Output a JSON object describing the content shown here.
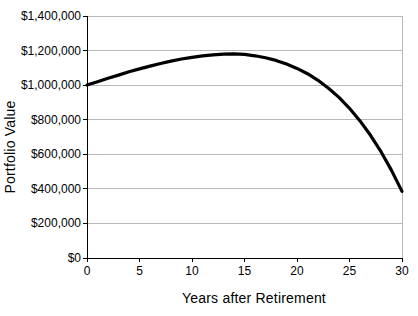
{
  "chart_data": {
    "type": "line",
    "title": "",
    "xlabel": "Years after Retirement",
    "ylabel": "Portfolio Value",
    "x": [
      0,
      1,
      2,
      3,
      4,
      5,
      6,
      7,
      8,
      9,
      10,
      11,
      12,
      13,
      14,
      15,
      16,
      17,
      18,
      19,
      20,
      21,
      22,
      23,
      24,
      25,
      26,
      27,
      28,
      29,
      30
    ],
    "values": [
      1000000,
      1020000,
      1040000,
      1058000,
      1077000,
      1094000,
      1110000,
      1125000,
      1139000,
      1151000,
      1161000,
      1169000,
      1175000,
      1179000,
      1181000,
      1178000,
      1170000,
      1158000,
      1143000,
      1122000,
      1097000,
      1066000,
      1028000,
      982000,
      929000,
      866000,
      793000,
      710000,
      615000,
      507000,
      385000
    ],
    "xlim": [
      0,
      30
    ],
    "ylim": [
      0,
      1400000
    ],
    "x_ticks": [
      0,
      5,
      10,
      15,
      20,
      25,
      30
    ],
    "x_tick_labels": [
      "0",
      "5",
      "10",
      "15",
      "20",
      "25",
      "30"
    ],
    "y_ticks": [
      0,
      200000,
      400000,
      600000,
      800000,
      1000000,
      1200000,
      1400000
    ],
    "y_tick_labels": [
      "$0",
      "$200,000",
      "$400,000",
      "$600,000",
      "$800,000",
      "$1,000,000",
      "$1,200,000",
      "$1,400,000"
    ],
    "grid": "horizontal",
    "legend": "none",
    "line_color": "#000000",
    "axis_color": "#000000",
    "gridline_color": "#b9b9b9",
    "plot_border_color": "#b9b9b9",
    "tick_label_color": "#000000",
    "background": "#ffffff"
  }
}
